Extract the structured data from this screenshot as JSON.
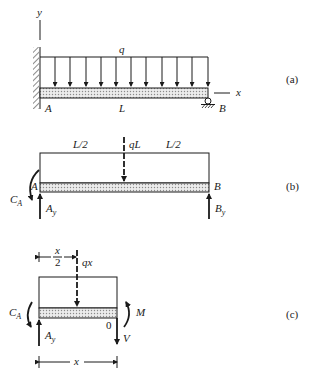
{
  "figure": {
    "panel_a": {
      "caption": "(a)",
      "axis_y": "y",
      "axis_x": "x",
      "load_label": "q",
      "point_A": "A",
      "point_B": "B",
      "length_label": "L",
      "load_arrow_count": 11
    },
    "panel_b": {
      "caption": "(b)",
      "left_span": "L/2",
      "right_span": "L/2",
      "resultant": "qL",
      "point_A": "A",
      "point_B": "B",
      "moment_A": "C",
      "moment_A_sub": "A",
      "reaction_A": "A",
      "reaction_A_sub": "y",
      "reaction_B": "B",
      "reaction_B_sub": "y"
    },
    "panel_c": {
      "caption": "(c)",
      "half_num": "x",
      "half_den": "2",
      "resultant": "qx",
      "moment_A": "C",
      "moment_A_sub": "A",
      "reaction_A": "A",
      "reaction_A_sub": "y",
      "cut_point": "0",
      "moment": "M",
      "shear": "V",
      "length_label": "x"
    }
  },
  "colors": {
    "ink": "#1a1a1a",
    "beam_fill": "#d9d9d9",
    "background": "#ffffff"
  }
}
